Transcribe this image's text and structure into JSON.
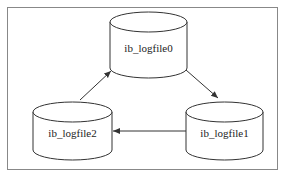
{
  "diagram": {
    "type": "cycle",
    "nodes": [
      {
        "id": "n0",
        "label": "ib_logfile0",
        "shape": "cylinder"
      },
      {
        "id": "n1",
        "label": "ib_logfile1",
        "shape": "cylinder"
      },
      {
        "id": "n2",
        "label": "ib_logfile2",
        "shape": "cylinder"
      }
    ],
    "edges": [
      {
        "from": "ib_logfile0",
        "to": "ib_logfile1"
      },
      {
        "from": "ib_logfile1",
        "to": "ib_logfile2"
      },
      {
        "from": "ib_logfile2",
        "to": "ib_logfile0"
      }
    ],
    "colors": {
      "stroke": "#333333",
      "frame": "#888888",
      "fill": "#ffffff"
    }
  }
}
